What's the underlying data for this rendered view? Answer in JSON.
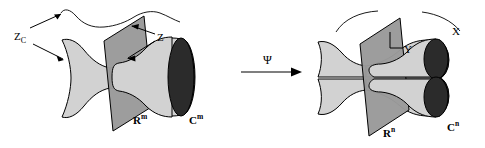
{
  "figure": {
    "colors": {
      "tube_fill": "#d2d2d2",
      "plane_fill": "#9a9a9a",
      "cap_fill": "#2b2b2b",
      "stroke": "#000000",
      "background": "#ffffff"
    },
    "left_panel": {
      "labels": {
        "zc": {
          "text": "Z",
          "sub": "C"
        },
        "z": {
          "text": "Z"
        },
        "domain": {
          "text": "R",
          "sup": "m"
        },
        "codomain": {
          "text": "C",
          "sup": "m"
        }
      },
      "shapes": {
        "hyperboloid": "single-waisted-tube",
        "plane": "slanted-parallelogram",
        "cap": "dark-ellipse-single",
        "curve": "wavy-curve-continuous"
      }
    },
    "map": {
      "symbol": "Ψ",
      "arrow": "rightwards-arrow"
    },
    "right_panel": {
      "labels": {
        "y": {
          "text": "Y"
        },
        "x": {
          "text": "X"
        },
        "domain": {
          "text": "R",
          "sup": "n"
        },
        "codomain": {
          "text": "C",
          "sup": "n"
        }
      },
      "shapes": {
        "hyperboloid": "split-tube-pair",
        "plane": "slanted-parallelogram",
        "cap": "dark-ellipse-pair",
        "curve": "arc-pair-split"
      }
    }
  }
}
